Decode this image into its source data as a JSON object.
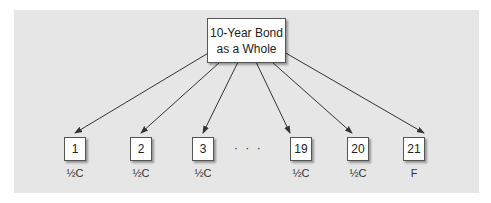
{
  "diagram": {
    "root": {
      "line1": "10-Year Bond",
      "line2": "as a Whole"
    },
    "leaves": [
      {
        "number": "1",
        "label": "½C"
      },
      {
        "number": "2",
        "label": "½C"
      },
      {
        "number": "3",
        "label": "½C"
      },
      {
        "number": "19",
        "label": "½C"
      },
      {
        "number": "20",
        "label": "½C"
      },
      {
        "number": "21",
        "label": "F"
      }
    ],
    "ellipsis": "· · ·",
    "colors": {
      "panel": "#e6e6e6",
      "box": "#ffffff",
      "arrow": "#333333"
    }
  }
}
